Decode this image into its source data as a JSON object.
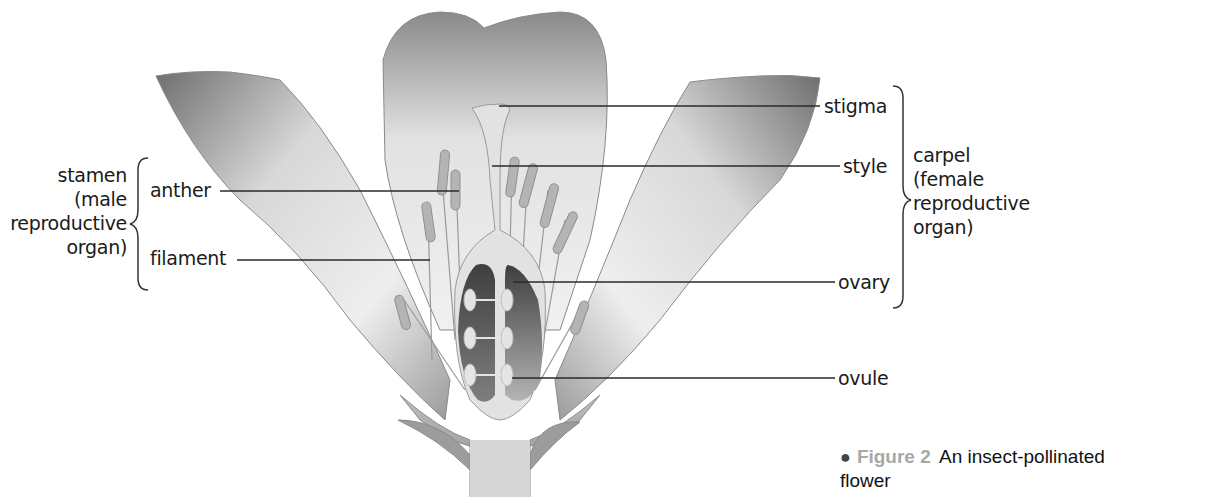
{
  "figure": {
    "title": "Figure 2",
    "caption": "An insect-pollinated flower",
    "caption_line1": "An insect-pollinated",
    "caption_line2": "flower",
    "bullet": "●"
  },
  "labels": {
    "left_group": {
      "name_lines": [
        "stamen",
        "(male",
        "reproductive",
        "organ)"
      ],
      "parts": [
        "anther",
        "filament"
      ]
    },
    "right_group": {
      "name_lines": [
        "carpel",
        "(female",
        "reproductive",
        "organ)"
      ],
      "parts": [
        "stigma",
        "style",
        "ovary"
      ]
    },
    "other": [
      "ovule"
    ]
  },
  "colors": {
    "petal_dark": "#7a7a7a",
    "petal_light": "#ececec",
    "ovary_dark": "#4a4a4a",
    "line": "#333333",
    "caption_figure": "#a8a8a8"
  }
}
